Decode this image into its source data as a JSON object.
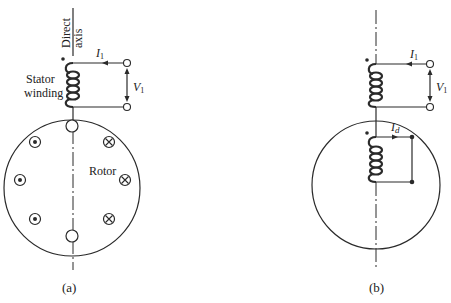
{
  "figure": {
    "panel_a": {
      "caption": "(a)",
      "axis_label_line1": "Direct",
      "axis_label_line2": "axis",
      "stator_label_line1": "Stator",
      "stator_label_line2": "winding",
      "rotor_label": "Rotor",
      "current_label": "I",
      "current_sub": "1",
      "voltage_label": "V",
      "voltage_sub": "1",
      "rotor_conductors": {
        "dot_side": [
          "dot",
          "dot",
          "dot"
        ],
        "cross_side": [
          "cross",
          "cross",
          "cross"
        ]
      }
    },
    "panel_b": {
      "caption": "(b)",
      "current_label": "I",
      "current_sub": "1",
      "voltage_label": "V",
      "voltage_sub": "1",
      "rotor_current_label": "I",
      "rotor_current_sub": "d"
    }
  },
  "colors": {
    "line": "#2a2a2a",
    "background": "#ffffff"
  }
}
